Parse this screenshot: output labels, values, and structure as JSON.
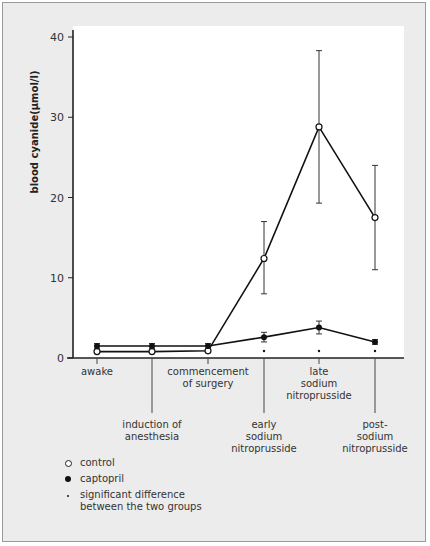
{
  "chart_data": {
    "type": "line",
    "title": "",
    "xlabel": "",
    "ylabel": "blood cyanide(µmol/l)",
    "ylim": [
      0,
      40
    ],
    "yticks": [
      0,
      10,
      20,
      30,
      40
    ],
    "grid": false,
    "legend_position": "bottom-left",
    "categories": [
      "awake",
      "induction of anesthesia",
      "commencement of surgery",
      "early sodium nitroprusside",
      "late sodium nitroprusside",
      "post-sodium nitroprusside"
    ],
    "category_label_lines": [
      [
        "awake"
      ],
      [
        "induction of",
        "anesthesia"
      ],
      [
        "commencement",
        "of surgery"
      ],
      [
        "early",
        "sodium",
        "nitroprusside"
      ],
      [
        "late",
        "sodium",
        "nitroprusside"
      ],
      [
        "post-",
        "sodium",
        "nitroprusside"
      ]
    ],
    "series": [
      {
        "name": "control",
        "marker": "open-circle",
        "values": [
          0.8,
          0.8,
          0.9,
          12.4,
          28.8,
          17.5
        ],
        "error_low": [
          0.8,
          0.8,
          0.9,
          8.0,
          19.3,
          11.0
        ],
        "error_high": [
          0.8,
          0.8,
          0.9,
          17.0,
          38.3,
          24.0
        ]
      },
      {
        "name": "captopril",
        "marker": "filled-circle",
        "values": [
          1.5,
          1.5,
          1.5,
          2.6,
          3.8,
          2.0
        ],
        "error_low": [
          1.2,
          1.2,
          1.2,
          2.0,
          3.0,
          1.7
        ],
        "error_high": [
          1.8,
          1.8,
          1.8,
          3.2,
          4.6,
          2.3
        ]
      }
    ],
    "significant_points": [
      3,
      4,
      5
    ]
  },
  "legend": {
    "items": [
      {
        "symbol": "open-circle",
        "label": "control"
      },
      {
        "symbol": "filled-circle",
        "label": "captopril"
      },
      {
        "symbol": "small-dot",
        "label": "significant difference between the two groups"
      }
    ]
  },
  "axis": {
    "y_label": "blood cyanide(µmol/l)",
    "y_ticks": [
      "0",
      "10",
      "20",
      "30",
      "40"
    ]
  }
}
